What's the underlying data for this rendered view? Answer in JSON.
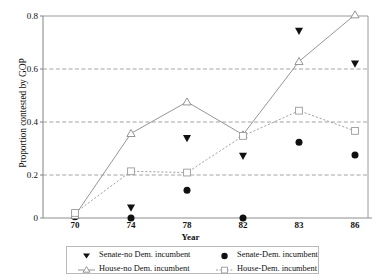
{
  "chart_data": {
    "type": "line",
    "title": "",
    "xlabel": "Year",
    "ylabel": "Proportion contested by GOP",
    "categories": [
      "70",
      "74",
      "78",
      "82",
      "83",
      "86"
    ],
    "x": [
      70,
      74,
      78,
      82,
      83,
      86
    ],
    "xlim": [
      0,
      5
    ],
    "ylim": [
      0,
      0.8
    ],
    "yticks": [
      "0",
      "0.2",
      "0.4",
      "0.6",
      "0.8"
    ],
    "ytick_values": [
      0,
      0.2,
      0.4,
      0.6,
      0.8
    ],
    "grid": "horizontal-dashed",
    "legend_position": "bottom",
    "series": [
      {
        "name": "Senate-no Dem. incumbent",
        "marker": "filled-down-triangle",
        "line": "none",
        "color": "#111111",
        "values": [
          0.01,
          0.04,
          0.315,
          0.245,
          0.74,
          0.61
        ]
      },
      {
        "name": "Senate-Dem. incumbent",
        "marker": "filled-circle",
        "line": "none",
        "color": "#111111",
        "values": [
          0.005,
          0.0,
          0.11,
          0.0,
          0.3,
          0.25
        ]
      },
      {
        "name": "House-no Dem. incumbent",
        "marker": "open-triangle",
        "line": "solid",
        "color": "#8a8a8a",
        "values": [
          0.01,
          0.335,
          0.46,
          0.33,
          0.62,
          0.805
        ]
      },
      {
        "name": "House-Dem. incumbent",
        "marker": "open-square",
        "line": "dotted",
        "color": "#9a9a9a",
        "values": [
          0.02,
          0.185,
          0.18,
          0.325,
          0.425,
          0.345
        ]
      }
    ]
  },
  "legend": {
    "rows": [
      [
        {
          "label": "Senate-no Dem. incumbent",
          "icon": "filled-down-triangle-icon"
        },
        {
          "label": "Senate-Dem. incumbent",
          "icon": "filled-circle-icon"
        }
      ],
      [
        {
          "label": "House-no Dem. incumbent",
          "icon": "open-triangle-line-icon"
        },
        {
          "label": "House-Dem. incumbent",
          "icon": "open-square-line-icon"
        }
      ]
    ]
  },
  "axes": {
    "xlabel": "Year",
    "ylabel": "Proportion contested by GOP",
    "ytick_labels": [
      "0.8",
      "0.6",
      "0.4",
      "0.2",
      "0"
    ],
    "xtick_labels": [
      "70",
      "74",
      "78",
      "82",
      "83",
      "86"
    ]
  },
  "colors": {
    "axis": "#8d8d8d",
    "grid": "#8d8d8d",
    "marker_dark": "#111111",
    "marker_light": "#8a8a8a",
    "background": "#ffffff"
  }
}
